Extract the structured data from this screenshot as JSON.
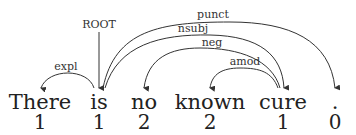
{
  "diagram": {
    "type": "dependency-parse",
    "root_label": "ROOT",
    "tokens": [
      {
        "word": "There",
        "index": "1"
      },
      {
        "word": "is",
        "index": "1"
      },
      {
        "word": "no",
        "index": "2"
      },
      {
        "word": "known",
        "index": "2"
      },
      {
        "word": "cure",
        "index": "1"
      },
      {
        "word": ".",
        "index": "0"
      }
    ],
    "arcs": [
      {
        "label": "expl",
        "head": "is",
        "dependent": "There"
      },
      {
        "label": "punct",
        "head": "is",
        "dependent": "."
      },
      {
        "label": "nsubj",
        "head": "is",
        "dependent": "cure"
      },
      {
        "label": "neg",
        "head": "cure",
        "dependent": "no"
      },
      {
        "label": "amod",
        "head": "cure",
        "dependent": "known"
      }
    ]
  }
}
